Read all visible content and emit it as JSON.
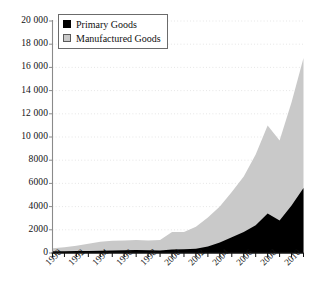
{
  "chart_data": {
    "type": "area",
    "stacked": true,
    "title": "",
    "subtitle": "",
    "xlabel": "",
    "ylabel": "",
    "x": [
      1990,
      1991,
      1992,
      1993,
      1994,
      1995,
      1996,
      1997,
      1998,
      1999,
      2000,
      2001,
      2002,
      2003,
      2004,
      2005,
      2006,
      2007,
      2008,
      2009,
      2010,
      2011
    ],
    "xlim": [
      1990,
      2011
    ],
    "ylim": [
      0,
      20000
    ],
    "ytick_values": [
      0,
      2000,
      4000,
      6000,
      8000,
      10000,
      12000,
      14000,
      16000,
      18000,
      20000
    ],
    "ytick_labels": [
      "0",
      "2000",
      "4000",
      "6000",
      "8000",
      "10 000",
      "12 000",
      "14 000",
      "16 000",
      "18 000",
      "20 000"
    ],
    "xtick_values": [
      1990,
      1992,
      1994,
      1996,
      1998,
      2000,
      2002,
      2004,
      2006,
      2008,
      2010
    ],
    "xtick_labels": [
      "1990",
      "1992",
      "1994",
      "1996",
      "1998",
      "2000",
      "2002",
      "2004",
      "2006",
      "2008",
      "2010"
    ],
    "xtick_minor_values": [
      1991,
      1993,
      1995,
      1997,
      1999,
      2001,
      2003,
      2005,
      2007,
      2009,
      2011
    ],
    "xtick_rotation": -45,
    "grid": "horizontal-dotted",
    "grid_color": "#d8d8d8",
    "legend_position": "top-left",
    "series": [
      {
        "name": "Primary Goods",
        "color": "#000000",
        "values": [
          150,
          160,
          170,
          180,
          200,
          220,
          240,
          250,
          230,
          220,
          300,
          320,
          360,
          560,
          900,
          1350,
          1800,
          2400,
          3400,
          2800,
          4100,
          5600
        ]
      },
      {
        "name": "Manufactured Goods",
        "color": "#c9c9c9",
        "values": [
          250,
          330,
          450,
          620,
          780,
          830,
          840,
          860,
          840,
          900,
          1500,
          1480,
          1900,
          2500,
          3100,
          3900,
          4800,
          6100,
          7600,
          6900,
          8900,
          11200
        ]
      }
    ],
    "totals": [
      400,
      490,
      620,
      800,
      980,
      1050,
      1080,
      1110,
      1070,
      1120,
      1800,
      1800,
      2260,
      3060,
      4000,
      5250,
      6600,
      8500,
      11000,
      9700,
      13000,
      16800
    ]
  },
  "legend": {
    "items": [
      {
        "label": "Primary Goods",
        "swatch": "black-square-swatch"
      },
      {
        "label": "Manufactured Goods",
        "swatch": "gray-square-swatch"
      }
    ]
  }
}
